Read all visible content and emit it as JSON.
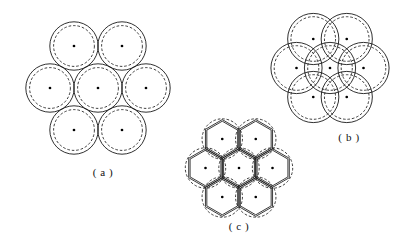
{
  "figure": {
    "type": "diagram",
    "background_color": "#ffffff",
    "line_color": "#1a1a1a",
    "dot_color": "#000000",
    "canvas": {
      "width": 414,
      "height": 251
    },
    "panels": [
      {
        "id": "a",
        "caption": "( a )",
        "caption_x": 103,
        "caption_y": 176,
        "arrangement": "hexagonal-close-packed-7",
        "center": {
          "x": 98,
          "y": 88
        },
        "spacing": 48.5,
        "outer_radius": 24.2,
        "inner_radius": 20.4,
        "outer_style": "solid",
        "inner_style": "dashed",
        "center_dot_radius": 1.35,
        "circle_centers": [
          {
            "x": 98,
            "y": 88
          },
          {
            "x": 74,
            "y": 46
          },
          {
            "x": 122,
            "y": 46
          },
          {
            "x": 50,
            "y": 88
          },
          {
            "x": 146,
            "y": 88
          },
          {
            "x": 74,
            "y": 130
          },
          {
            "x": 122,
            "y": 130
          }
        ]
      },
      {
        "id": "b",
        "caption": "( b )",
        "caption_x": 349,
        "caption_y": 141,
        "arrangement": "hexagonal-overlapping-7",
        "center": {
          "x": 330,
          "y": 68
        },
        "spacing": 33.5,
        "outer_radius": 25.6,
        "inner_radius": 22.3,
        "outer_style": "solid",
        "inner_style": "dashed",
        "center_dot_radius": 1.35,
        "circle_centers": [
          {
            "x": 330,
            "y": 68
          },
          {
            "x": 313.25,
            "y": 39
          },
          {
            "x": 346.75,
            "y": 39
          },
          {
            "x": 296.5,
            "y": 68
          },
          {
            "x": 363.5,
            "y": 68
          },
          {
            "x": 313.25,
            "y": 97
          },
          {
            "x": 346.75,
            "y": 97
          }
        ]
      },
      {
        "id": "c",
        "caption": "( c )",
        "caption_x": 239,
        "caption_y": 230,
        "arrangement": "hexagonal-dashed-with-honeycomb-lattice",
        "center": {
          "x": 239,
          "y": 168
        },
        "spacing": 33.5,
        "outer_radius": 20.2,
        "inner_radius": 0,
        "outer_style": "dashed",
        "lattice": "honeycomb",
        "lattice_cell_radius": 19.4,
        "center_dot_radius": 1.3,
        "circle_centers": [
          {
            "x": 239,
            "y": 168
          },
          {
            "x": 222.25,
            "y": 139
          },
          {
            "x": 255.75,
            "y": 139
          },
          {
            "x": 205.5,
            "y": 168
          },
          {
            "x": 272.5,
            "y": 168
          },
          {
            "x": 222.25,
            "y": 197
          },
          {
            "x": 255.75,
            "y": 197
          }
        ]
      }
    ]
  }
}
